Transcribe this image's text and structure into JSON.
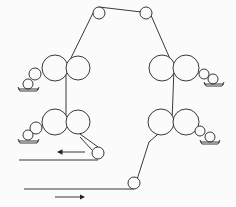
{
  "diagram": {
    "type": "roller-web-path",
    "stroke": "#222222",
    "background": "#fbfbfb",
    "rollers": [
      {
        "id": "top-left",
        "cx": 99,
        "cy": 13,
        "r": 6
      },
      {
        "id": "top-right",
        "cx": 146,
        "cy": 13,
        "r": 6
      },
      {
        "id": "left-upper-1",
        "cx": 55,
        "cy": 68,
        "r": 13
      },
      {
        "id": "left-upper-2",
        "cx": 78,
        "cy": 68,
        "r": 12
      },
      {
        "id": "left-upper-small-1",
        "cx": 35,
        "cy": 74,
        "r": 6
      },
      {
        "id": "left-upper-small-2",
        "cx": 28,
        "cy": 84,
        "r": 5
      },
      {
        "id": "left-lower-1",
        "cx": 55,
        "cy": 122,
        "r": 13
      },
      {
        "id": "left-lower-2",
        "cx": 78,
        "cy": 122,
        "r": 12
      },
      {
        "id": "left-lower-small-1",
        "cx": 36,
        "cy": 128,
        "r": 6
      },
      {
        "id": "left-lower-small-2",
        "cx": 28,
        "cy": 135,
        "r": 5
      },
      {
        "id": "right-upper-1",
        "cx": 162,
        "cy": 68,
        "r": 13
      },
      {
        "id": "right-upper-2",
        "cx": 186,
        "cy": 68,
        "r": 13
      },
      {
        "id": "right-upper-small-1",
        "cx": 204,
        "cy": 74,
        "r": 5
      },
      {
        "id": "right-upper-small-2",
        "cx": 213,
        "cy": 79,
        "r": 5
      },
      {
        "id": "right-lower-1",
        "cx": 161,
        "cy": 122,
        "r": 13
      },
      {
        "id": "right-lower-2",
        "cx": 186,
        "cy": 122,
        "r": 13
      },
      {
        "id": "right-lower-small-1",
        "cx": 200,
        "cy": 131,
        "r": 5
      },
      {
        "id": "right-lower-small-2",
        "cx": 210,
        "cy": 137,
        "r": 5
      },
      {
        "id": "exit-roller",
        "cx": 98,
        "cy": 153,
        "r": 6
      },
      {
        "id": "entry-roller",
        "cx": 134,
        "cy": 183,
        "r": 6
      }
    ],
    "arrows": [
      {
        "id": "exit-arrow",
        "direction": "left"
      },
      {
        "id": "entry-arrow",
        "direction": "right"
      }
    ]
  }
}
